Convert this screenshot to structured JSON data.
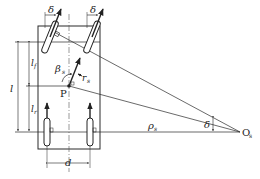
{
  "diagram": {
    "type": "vehicle steering kinematics (Ackermann geometry)",
    "labels": {
      "delta_front_left": "δ",
      "delta_front_right": "δ",
      "delta_angle": "δ",
      "beta": "β",
      "beta_sub": "s",
      "r": "r",
      "r_sub": "s",
      "point_p": "P",
      "rho": "ρ",
      "rho_sub": "s",
      "center": "O",
      "center_sub": "s",
      "l": "l",
      "lf": "l",
      "lf_sub": "f",
      "lr": "l",
      "lr_sub": "r",
      "d": "d"
    },
    "colors": {
      "line": "#2a2a2a",
      "background": "#ffffff"
    }
  }
}
